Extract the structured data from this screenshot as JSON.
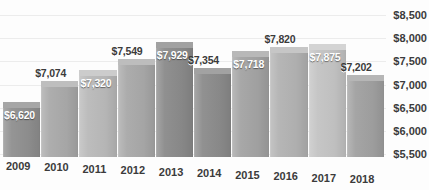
{
  "chart_data": {
    "type": "bar",
    "title": "",
    "subtitle": "",
    "xlabel": "",
    "ylabel": "",
    "categories": [
      "2009",
      "2010",
      "2011",
      "2012",
      "2013",
      "2014",
      "2015",
      "2016",
      "2017",
      "2018"
    ],
    "values": [
      6620,
      7074,
      7320,
      7549,
      7929,
      7354,
      7718,
      7820,
      7875,
      7202
    ],
    "value_labels": [
      "$6,620",
      "$7,074",
      "$7,320",
      "$7,549",
      "$7,929",
      "$7,354",
      "$7,718",
      "$7,820",
      "$7,875",
      "$7,202"
    ],
    "label_placement": [
      "inside",
      "outside",
      "inside",
      "outside",
      "inside",
      "outside",
      "inside",
      "outside",
      "inside",
      "outside"
    ],
    "bar_colors": [
      "#8f8f8f",
      "#a9a9a9",
      "#b9b9b9",
      "#a8a8a8",
      "#8a8a8a",
      "#8b8b8b",
      "#a3a3a3",
      "#b2b2b2",
      "#c3c3c3",
      "#a0a0a0"
    ],
    "bar_top_colors": [
      "#a6a6a6",
      "#bebebe",
      "#cccccc",
      "#bdbdbd",
      "#a1a1a1",
      "#a2a2a2",
      "#b8b8b8",
      "#c6c6c6",
      "#d4d4d4",
      "#b6b6b6"
    ],
    "ytick_labels": [
      "$8,500",
      "$8,000",
      "$7,500",
      "$7,000",
      "$6,500",
      "$6,000",
      "$5,500"
    ],
    "yticks": [
      8500,
      8000,
      7500,
      7000,
      6500,
      6000,
      5500
    ],
    "ylim": [
      5400,
      8600
    ],
    "grid": true,
    "legend": false,
    "legend_position": "none",
    "y_axis_position": "right",
    "style": "3d-column"
  }
}
